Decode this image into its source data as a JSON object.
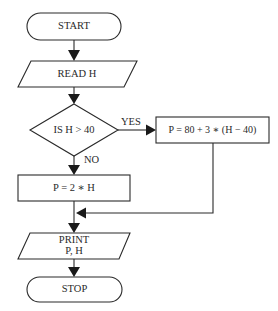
{
  "flowchart": {
    "nodes": {
      "start": {
        "type": "terminal",
        "label": "START"
      },
      "read": {
        "type": "input-output",
        "label": "READ H"
      },
      "decision": {
        "type": "decision",
        "label": "IS H > 40"
      },
      "yes_process": {
        "type": "process",
        "label": "P = 80 + 3 ∗ (H − 40)"
      },
      "no_process": {
        "type": "process",
        "label": "P = 2 ∗ H"
      },
      "print": {
        "type": "input-output",
        "label_line1": "PRINT",
        "label_line2": "P, H"
      },
      "stop": {
        "type": "terminal",
        "label": "STOP"
      }
    },
    "edges": {
      "yes_label": "YES",
      "no_label": "NO"
    },
    "colors": {
      "stroke": "#2a2a2a",
      "background": "#ffffff"
    }
  }
}
